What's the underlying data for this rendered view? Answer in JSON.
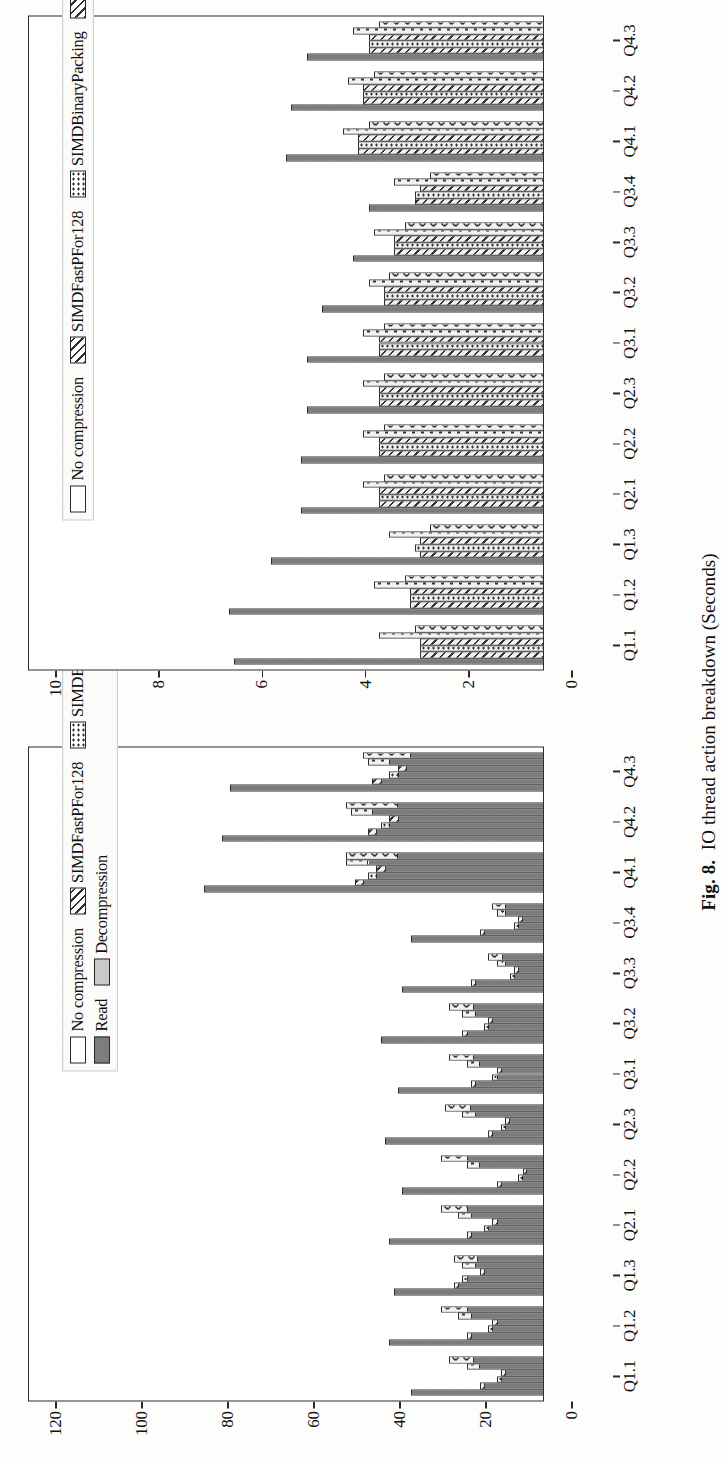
{
  "caption": {
    "prefix": "Fig. 8.",
    "text": "IO thread action breakdown (Seconds)"
  },
  "methods": [
    {
      "key": "nocomp",
      "label": "No compression",
      "fill": "f-white"
    },
    {
      "key": "sfp128",
      "label": "SIMDFastPFor128",
      "fill": "f-hatch"
    },
    {
      "key": "sbp",
      "label": "SIMDBinaryPacking",
      "fill": "f-dotsm"
    },
    {
      "key": "pfor",
      "label": "PFor",
      "fill": "f-hatch2"
    },
    {
      "key": "vbyte",
      "label": "VByte",
      "fill": "f-dots"
    },
    {
      "key": "brotli",
      "label": "Brotli",
      "fill": "f-circ"
    }
  ],
  "stack_legend": [
    {
      "key": "read",
      "label": "Read",
      "fill": "f-solid"
    },
    {
      "key": "decomp",
      "label": "Decompression",
      "fill": "f-light"
    }
  ],
  "chart_data": [
    {
      "id": "io-thread-top",
      "type": "bar",
      "orientation": "horizontal-scan-rotated",
      "title": "",
      "xlabel": "",
      "ylabel": "Seconds",
      "ylim": [
        0,
        120
      ],
      "yticks": [
        0,
        20,
        40,
        60,
        80,
        100,
        120
      ],
      "grid": false,
      "legend_position": "top-right",
      "stacked": true,
      "stack_order": [
        "read",
        "decomp"
      ],
      "categories": [
        "Q1.1",
        "Q1.2",
        "Q1.3",
        "Q2.1",
        "Q2.2",
        "Q2.3",
        "Q3.1",
        "Q3.2",
        "Q3.3",
        "Q3.4",
        "Q4.1",
        "Q4.2",
        "Q4.3"
      ],
      "series": [
        {
          "name": "No compression",
          "stack": "read",
          "values": [
            31,
            36,
            35,
            36,
            33,
            37,
            34,
            38,
            33,
            31,
            79,
            75,
            73
          ]
        },
        {
          "name": "No compression",
          "stack": "decomp",
          "values": [
            0,
            0,
            0,
            0,
            0,
            0,
            0,
            0,
            0,
            0,
            0,
            0,
            0
          ]
        },
        {
          "name": "SIMDFastPFor128",
          "stack": "read",
          "values": [
            14,
            17,
            20,
            17,
            10,
            12,
            16,
            18,
            16,
            14,
            42,
            39,
            38
          ]
        },
        {
          "name": "SIMDFastPFor128",
          "stack": "decomp",
          "values": [
            1,
            1,
            1,
            1,
            1,
            1,
            1,
            1,
            1,
            1,
            2,
            2,
            2
          ]
        },
        {
          "name": "SIMDBinaryPacking",
          "stack": "read",
          "values": [
            10,
            12,
            18,
            13,
            5,
            9,
            11,
            13,
            7,
            6,
            39,
            36,
            34
          ]
        },
        {
          "name": "SIMDBinaryPacking",
          "stack": "decomp",
          "values": [
            1,
            1,
            1,
            1,
            1,
            1,
            1,
            1,
            1,
            1,
            2,
            2,
            2
          ]
        },
        {
          "name": "PFor",
          "stack": "read",
          "values": [
            9,
            11,
            14,
            11,
            4,
            8,
            10,
            12,
            6,
            5,
            37,
            34,
            32
          ]
        },
        {
          "name": "PFor",
          "stack": "decomp",
          "values": [
            1,
            1,
            1,
            1,
            1,
            1,
            1,
            1,
            1,
            1,
            2,
            2,
            2
          ]
        },
        {
          "name": "VByte",
          "stack": "read",
          "values": [
            15,
            17,
            16,
            17,
            15,
            16,
            15,
            16,
            9,
            9,
            41,
            40,
            36
          ]
        },
        {
          "name": "VByte",
          "stack": "decomp",
          "values": [
            3,
            3,
            3,
            3,
            3,
            3,
            3,
            3,
            2,
            2,
            5,
            5,
            5
          ]
        },
        {
          "name": "Brotli",
          "stack": "read",
          "values": [
            22,
            24,
            21,
            24,
            24,
            23,
            22,
            22,
            13,
            12,
            46,
            46,
            42
          ]
        },
        {
          "name": "Brotli",
          "stack": "decomp",
          "values": [
            0,
            0,
            0,
            0,
            0,
            0,
            0,
            0,
            0,
            0,
            0,
            0,
            0
          ]
        }
      ]
    },
    {
      "id": "io-thread-bottom",
      "type": "bar",
      "orientation": "horizontal-scan-rotated",
      "title": "",
      "xlabel": "",
      "ylabel": "Seconds",
      "ylim": [
        0,
        10
      ],
      "yticks": [
        0,
        2,
        4,
        6,
        8,
        10
      ],
      "grid": false,
      "legend_position": "top-right",
      "stacked": false,
      "categories": [
        "Q1.1",
        "Q1.2",
        "Q1.3",
        "Q2.1",
        "Q2.2",
        "Q2.3",
        "Q3.1",
        "Q3.2",
        "Q3.3",
        "Q3.4",
        "Q4.1",
        "Q4.2",
        "Q4.3"
      ],
      "series": [
        {
          "name": "No compression",
          "values": [
            6.0,
            6.1,
            5.3,
            4.7,
            4.7,
            4.6,
            4.6,
            4.3,
            3.7,
            3.4,
            5.0,
            4.9,
            4.6
          ]
        },
        {
          "name": "SIMDFastPFor128",
          "values": [
            2.4,
            2.6,
            2.4,
            3.2,
            3.2,
            3.2,
            3.2,
            3.1,
            2.9,
            2.5,
            3.6,
            3.5,
            3.4
          ]
        },
        {
          "name": "SIMDBinaryPacking",
          "values": [
            2.4,
            2.6,
            2.5,
            3.2,
            3.2,
            3.2,
            3.2,
            3.1,
            2.9,
            2.5,
            3.6,
            3.5,
            3.4
          ]
        },
        {
          "name": "PFor",
          "values": [
            2.4,
            2.6,
            2.4,
            3.2,
            3.2,
            3.2,
            3.2,
            3.1,
            2.9,
            2.4,
            3.6,
            3.5,
            3.4
          ]
        },
        {
          "name": "VByte",
          "values": [
            3.2,
            3.3,
            3.0,
            3.5,
            3.5,
            3.5,
            3.5,
            3.4,
            3.3,
            2.9,
            3.9,
            3.8,
            3.7
          ]
        },
        {
          "name": "Brotli",
          "values": [
            2.5,
            2.7,
            2.2,
            3.1,
            3.1,
            3.1,
            3.1,
            3.0,
            2.7,
            2.2,
            3.4,
            3.3,
            3.2
          ]
        }
      ]
    }
  ]
}
